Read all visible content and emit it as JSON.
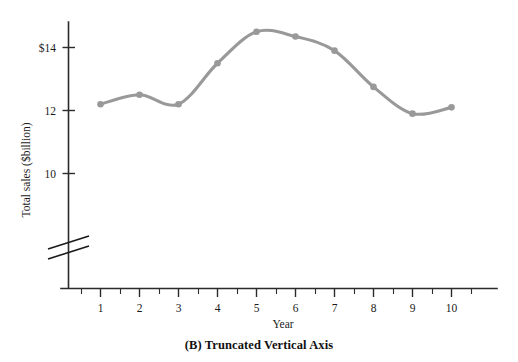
{
  "figure": {
    "caption": "(B) Truncated Vertical Axis"
  },
  "chart_data": {
    "type": "line",
    "title": "",
    "subtitle": "",
    "xlabel": "Year",
    "ylabel": "Total sales ($billion)",
    "x": [
      1,
      2,
      3,
      4,
      5,
      6,
      7,
      8,
      9,
      10
    ],
    "categories": [
      "1",
      "2",
      "3",
      "4",
      "5",
      "6",
      "7",
      "8",
      "9",
      "10"
    ],
    "values": [
      12.2,
      12.5,
      12.2,
      13.5,
      14.5,
      14.35,
      13.9,
      12.75,
      11.9,
      12.1
    ],
    "series": [
      {
        "name": "Total sales",
        "values": [
          12.2,
          12.5,
          12.2,
          13.5,
          14.5,
          14.35,
          13.9,
          12.75,
          11.9,
          12.1
        ],
        "color": "#999999",
        "marker": "circle",
        "smoothing": "spline"
      }
    ],
    "xlim": [
      0.45,
      10.9
    ],
    "ylim": [
      9.0,
      15.2
    ],
    "y_ticks": [
      10,
      12,
      14
    ],
    "y_tick_labels": [
      "10",
      "12",
      "$14"
    ],
    "x_ticks": [
      1,
      2,
      3,
      4,
      5,
      6,
      7,
      8,
      9,
      10
    ],
    "x_tick_labels": [
      "1",
      "2",
      "3",
      "4",
      "5",
      "6",
      "7",
      "8",
      "9",
      "10"
    ],
    "x_minor_ticks": [
      1.5,
      2.5,
      3.5,
      4.5,
      5.5,
      6.5,
      7.5,
      8.5,
      9.5
    ],
    "grid": false,
    "legend": false,
    "legend_position": "none",
    "axis_break": {
      "axis": "y",
      "label": "truncated-vertical-axis",
      "present": true
    },
    "annotations": []
  },
  "style": {
    "background": "#ffffff",
    "axis_color": "#2b2b2b",
    "text_color": "#1a1a1a",
    "series_color": "#999999"
  }
}
